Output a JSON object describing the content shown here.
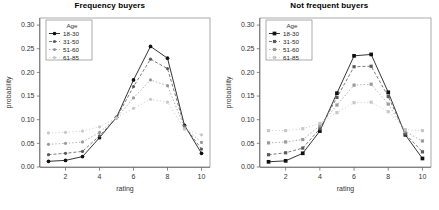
{
  "figure": {
    "panels": [
      {
        "title": "Frequency buyers",
        "xlabel": "rating",
        "ylabel": "probability"
      },
      {
        "title": "Not frequent buyers",
        "xlabel": "rating",
        "ylabel": "probability"
      }
    ],
    "legend": {
      "title": "Age",
      "entries": [
        "18-30",
        "31-50",
        "51-60",
        "61-85"
      ]
    },
    "yticks": [
      "0.00",
      "0.05",
      "0.10",
      "0.15",
      "0.20",
      "0.25",
      "0.30"
    ],
    "xticks": [
      "2",
      "4",
      "6",
      "8",
      "10"
    ],
    "colors": {
      "series_18_30": "#101010",
      "series_31_50": "#5a5a5a",
      "series_51_60": "#9a9a9a",
      "series_61_85": "#c8c8c8",
      "axis": "#555555",
      "frame": "#888888",
      "background": "#ffffff"
    }
  },
  "chart_data": [
    {
      "type": "line",
      "title": "Frequency buyers",
      "xlabel": "rating",
      "ylabel": "probability",
      "x": [
        1,
        2,
        3,
        4,
        5,
        6,
        7,
        8,
        9,
        10
      ],
      "xlim": [
        0.5,
        10.5
      ],
      "ylim": [
        0.0,
        0.315
      ],
      "xticks": [
        2,
        4,
        6,
        8,
        10
      ],
      "yticks": [
        0.0,
        0.05,
        0.1,
        0.15,
        0.2,
        0.25,
        0.3
      ],
      "grid": false,
      "legend": "inside-top-left",
      "legend_title": "Age",
      "series": [
        {
          "name": "18-30",
          "values": [
            0.012,
            0.014,
            0.022,
            0.062,
            0.105,
            0.184,
            0.255,
            0.23,
            0.088,
            0.029
          ]
        },
        {
          "name": "31-50",
          "values": [
            0.026,
            0.029,
            0.033,
            0.066,
            0.104,
            0.17,
            0.228,
            0.208,
            0.086,
            0.038
          ]
        },
        {
          "name": "51-60",
          "values": [
            0.048,
            0.05,
            0.053,
            0.073,
            0.104,
            0.146,
            0.184,
            0.172,
            0.083,
            0.052
          ]
        },
        {
          "name": "61-85",
          "values": [
            0.072,
            0.073,
            0.076,
            0.085,
            0.104,
            0.124,
            0.143,
            0.137,
            0.08,
            0.068
          ]
        }
      ]
    },
    {
      "type": "line",
      "title": "Not frequent buyers",
      "xlabel": "rating",
      "ylabel": "probability",
      "x": [
        1,
        2,
        3,
        4,
        5,
        6,
        7,
        8,
        9,
        10
      ],
      "xlim": [
        0.5,
        10.5
      ],
      "ylim": [
        0.0,
        0.315
      ],
      "xticks": [
        2,
        4,
        6,
        8,
        10
      ],
      "yticks": [
        0.0,
        0.05,
        0.1,
        0.15,
        0.2,
        0.25,
        0.3
      ],
      "grid": false,
      "legend": "inside-top-left",
      "legend_title": "Age",
      "series": [
        {
          "name": "18-30",
          "values": [
            0.011,
            0.013,
            0.029,
            0.076,
            0.156,
            0.235,
            0.238,
            0.158,
            0.068,
            0.018
          ]
        },
        {
          "name": "31-50",
          "values": [
            0.026,
            0.03,
            0.04,
            0.081,
            0.147,
            0.212,
            0.213,
            0.149,
            0.07,
            0.032
          ]
        },
        {
          "name": "51-60",
          "values": [
            0.051,
            0.053,
            0.058,
            0.087,
            0.131,
            0.173,
            0.175,
            0.133,
            0.075,
            0.055
          ]
        },
        {
          "name": "61-85",
          "values": [
            0.077,
            0.077,
            0.081,
            0.092,
            0.115,
            0.136,
            0.137,
            0.117,
            0.079,
            0.077
          ]
        }
      ]
    }
  ]
}
